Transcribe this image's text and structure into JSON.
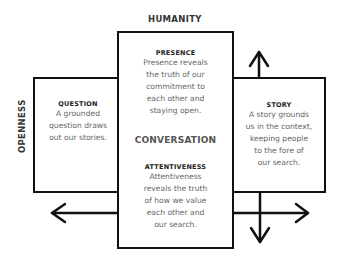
{
  "axes": {
    "top_label": "HUMANITY",
    "left_label": "OPENNESS"
  },
  "center": {
    "title": "CONVERSATION",
    "presence": {
      "title": "PRESENCE",
      "lines": [
        "Presence reveals",
        "the truth of our",
        "commitment to",
        "each other and",
        "staying open."
      ]
    },
    "attentiveness": {
      "title": "ATTENTIVENESS",
      "lines": [
        "Attentiveness",
        "reveals the truth",
        "of how we value",
        "each other and",
        "our search."
      ]
    }
  },
  "left": {
    "title": "QUESTION",
    "lines": [
      "A grounded",
      "question draws",
      "out our stories."
    ]
  },
  "right": {
    "title": "STORY",
    "lines": [
      "A story grounds",
      "us in the context,",
      "keeping people",
      "to the fore of",
      "our search."
    ]
  },
  "arrows": [
    {
      "name": "up-arrow",
      "direction": "up"
    },
    {
      "name": "down-arrow",
      "direction": "down"
    },
    {
      "name": "left-arrow",
      "direction": "left"
    },
    {
      "name": "right-arrow",
      "direction": "right"
    }
  ],
  "colors": {
    "stroke": "#111111",
    "title_text": "#222222",
    "body_text": "#666666"
  }
}
